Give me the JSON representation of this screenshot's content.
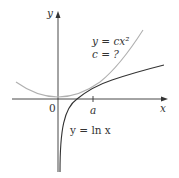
{
  "figure": {
    "axes": {
      "x_label": "x",
      "y_label": "y",
      "origin_label": "0",
      "tick_label": "a"
    },
    "curves": [
      {
        "name": "parabola",
        "label_line1": "y = cx²",
        "label_line2": "c = ?",
        "color": "#b0b0b0"
      },
      {
        "name": "logarithm",
        "label": "y = ln x",
        "color": "#333333"
      }
    ],
    "colors": {
      "axis": "#333333",
      "parabola": "#b0b0b0",
      "log_curve": "#333333",
      "text": "#333333"
    }
  }
}
